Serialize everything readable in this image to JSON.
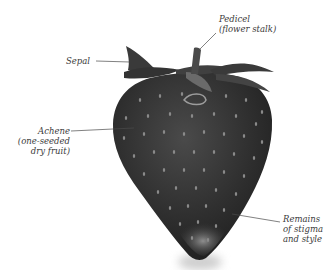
{
  "diagram": {
    "labels": {
      "pedicel": {
        "lines": [
          "Pedicel",
          "(flower stalk)"
        ]
      },
      "sepal": {
        "lines": [
          "Sepal"
        ]
      },
      "achene": {
        "lines": [
          "Achene",
          "(one-seeded",
          "dry fruit)"
        ]
      },
      "remains": {
        "lines": [
          "Remains",
          "of  stigma",
          "and style"
        ]
      }
    },
    "colors": {
      "background": "#ffffff",
      "fruit": "#2e2e2e",
      "sepal": "#3c3c3c",
      "seed": "#8a8a8a",
      "leader_line": "#4a4a4a",
      "label_text": "#3a3a3a"
    }
  }
}
